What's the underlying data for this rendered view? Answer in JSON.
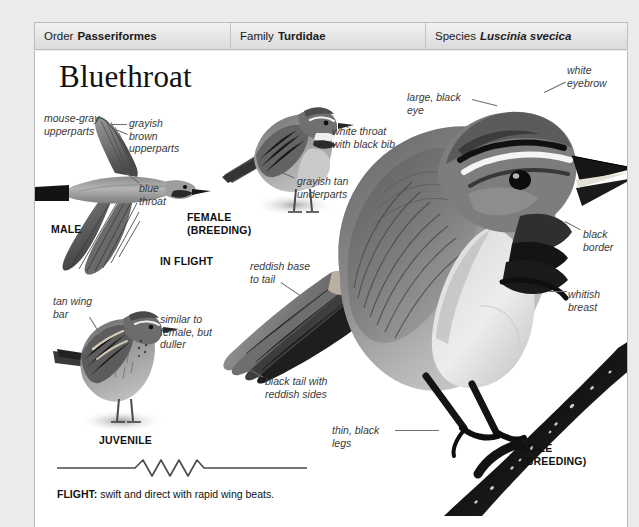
{
  "page": {
    "background": "#ebebeb",
    "plate_background": "#ffffff",
    "border_color": "#b9b9b9"
  },
  "taxonomy": {
    "order": {
      "label": "Order",
      "value": "Passeriformes"
    },
    "family": {
      "label": "Family",
      "value": "Turdidae"
    },
    "species": {
      "label": "Species",
      "value": "Luscinia svecica"
    }
  },
  "title": "Bluethroat",
  "annotations": {
    "grayish_brown_upperparts": "grayish\nbrown\nupperparts",
    "blue_throat": "blue\nthroat",
    "mouse_gray_upperparts": "mouse-gray\nupperparts",
    "white_throat_black_bib": "white throat\nwith black bib",
    "grayish_tan_underparts": "grayish tan\nunderparts",
    "large_black_eye": "large, black\neye",
    "white_eyebrow": "white\neyebrow",
    "black_border": "black\nborder",
    "whitish_breast": "whitish\nbreast",
    "reddish_base_to_tail": "reddish base\nto tail",
    "black_tail_reddish_sides": "black tail with\nreddish sides",
    "tan_wing_bar": "tan wing\nbar",
    "similar_to_female": "similar to\nfemale, but\nduller",
    "thin_black_legs": "thin, black\nlegs"
  },
  "captions": {
    "male": "MALE",
    "in_flight": "IN FLIGHT",
    "female_breeding": "FEMALE\n(BREEDING)",
    "juvenile": "JUVENILE",
    "male_breeding": "MALE\n(BREEDING)"
  },
  "flight": {
    "label": "FLIGHT:",
    "description": " swift and direct with rapid wing beats."
  }
}
